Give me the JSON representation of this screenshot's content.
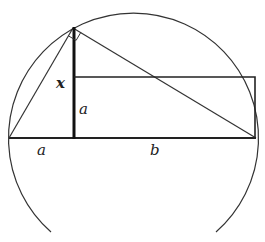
{
  "diagram": {
    "type": "geometry",
    "colors": {
      "stroke": "#333333",
      "background": "#ffffff"
    },
    "circle": {
      "cx": 132.5,
      "cy": 137,
      "r": 125
    },
    "points": {
      "left": [
        9,
        138
      ],
      "foot": [
        74,
        138
      ],
      "right": [
        255,
        138
      ],
      "apex": [
        73,
        28
      ],
      "rect_top_left": [
        74,
        77
      ],
      "rect_top_right": [
        255,
        77
      ]
    },
    "labels": {
      "x": "x",
      "a_vertical": "a",
      "a_horizontal": "a",
      "b": "b"
    }
  }
}
